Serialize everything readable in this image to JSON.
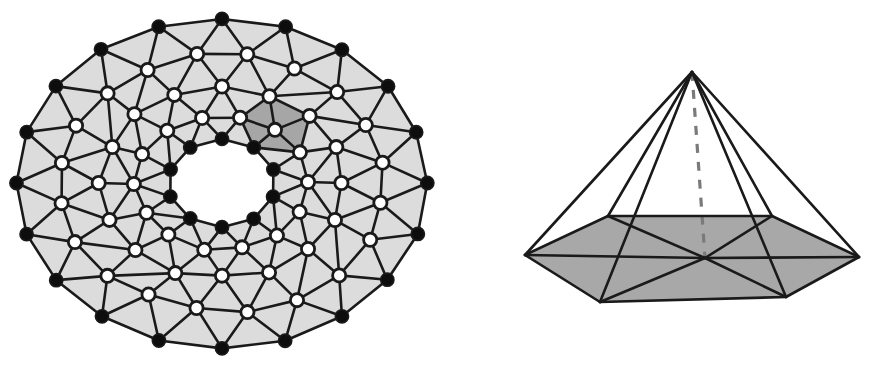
{
  "figure": {
    "background_color": "#ffffff",
    "panels": [
      {
        "id": "torus-panel",
        "name": "triangulated-annulus",
        "caption": ""
      },
      {
        "id": "cone-panel",
        "name": "hexagonal-cone",
        "caption": ""
      }
    ]
  },
  "palette": {
    "stroke": "#1a1a1a",
    "light_fill": "#dcdcdc",
    "dark_fill": "#a6a6a6",
    "base_fill": "#a8a8a8",
    "vertex_black": "#0d0d0d",
    "vertex_white": "#ffffff",
    "dashed_axis": "#7a7a7a"
  },
  "annulus": {
    "name": "triangulated-annulus",
    "description": "Disk with one hole, triangulated; boundary vertices solid, interior vertices hollow; star of one interior vertex shaded darker",
    "center": [
      222,
      183
    ],
    "rings": [
      {
        "id": "outer-boundary",
        "type": "boundary",
        "vertex_style": "black",
        "count": 20,
        "rx": 205,
        "ry": 165,
        "phase": 0
      },
      {
        "id": "ring-2",
        "type": "interior",
        "vertex_style": "white",
        "count": 20,
        "rx": 163,
        "ry": 128,
        "phase": 9
      },
      {
        "id": "ring-3",
        "type": "interior",
        "vertex_style": "white",
        "count": 16,
        "rx": 122,
        "ry": 95,
        "phase": 0
      },
      {
        "id": "ring-4",
        "type": "interior",
        "vertex_style": "white",
        "count": 14,
        "rx": 86,
        "ry": 67,
        "phase": 12
      },
      {
        "id": "inner-boundary",
        "type": "boundary",
        "vertex_style": "black",
        "count": 10,
        "rx": 54,
        "ry": 44,
        "phase": 0
      }
    ],
    "highlight": {
      "id": "shaded-star",
      "label": "star-of-vertex",
      "ring_index": 3,
      "vertex_index": 1,
      "triangle_count": 6,
      "fill": "#a6a6a6"
    },
    "counts": {
      "outer_boundary_vertices": 20,
      "inner_boundary_vertices": 10,
      "interior_vertices": 50
    }
  },
  "cone": {
    "name": "hexagonal-cone",
    "description": "Cone over a hexagon: apex joined to every base vertex and to the base centre; base shaded, central axis dashed",
    "apex": [
      232,
      72
    ],
    "base_center": [
      245,
      258
    ],
    "base_vertices": [
      [
        65,
        255
      ],
      [
        140,
        302
      ],
      [
        326,
        297
      ],
      [
        399,
        257
      ],
      [
        312,
        216
      ],
      [
        148,
        216
      ]
    ],
    "axis": {
      "from": [
        232,
        72
      ],
      "to": [
        245,
        258
      ],
      "style": "dashed",
      "dash": "9 9"
    },
    "base_fill": "#a8a8a8",
    "counts": {
      "base_vertices": 6,
      "apex_edges": 6,
      "base_spokes": 6
    }
  }
}
